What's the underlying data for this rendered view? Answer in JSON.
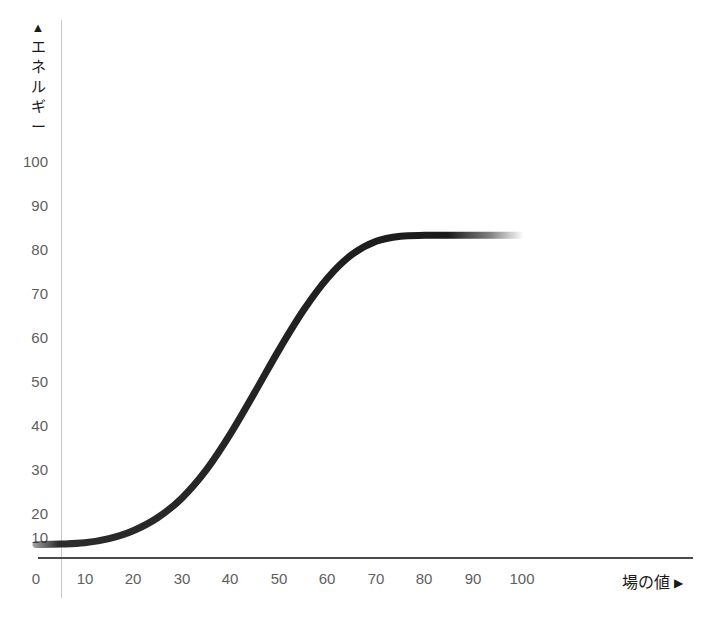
{
  "chart_data": {
    "type": "line",
    "title": "",
    "xlabel": "場の値",
    "ylabel": "エネルギー",
    "xlabel_arrow": "▶",
    "ylabel_arrow": "▲",
    "ylabel_chars": [
      "エ",
      "ネ",
      "ル",
      "ギ",
      "ー"
    ],
    "xticks": [
      0,
      10,
      20,
      30,
      40,
      50,
      60,
      70,
      80,
      90,
      100
    ],
    "xtick_labels": [
      "0",
      "10",
      "20",
      "30",
      "40",
      "50",
      "60",
      "70",
      "80",
      "90",
      "100"
    ],
    "yticks": [
      10,
      20,
      30,
      40,
      50,
      60,
      70,
      80,
      90,
      100
    ],
    "ytick_labels": [
      "10",
      "20",
      "30",
      "40",
      "50",
      "60",
      "70",
      "80",
      "90",
      "100"
    ],
    "xlim": [
      0,
      100
    ],
    "ylim": [
      0,
      108
    ],
    "grid": false,
    "legend": null,
    "series": [
      {
        "name": "energy-curve",
        "shape": "sigmoid",
        "color": "#1a1a1a",
        "line_width": 7,
        "fade_ends": true,
        "x": [
          0,
          5,
          10,
          15,
          20,
          25,
          30,
          35,
          40,
          45,
          50,
          55,
          60,
          65,
          70,
          75,
          80,
          85,
          90,
          95,
          100
        ],
        "y": [
          8.2,
          8.3,
          8.6,
          9.6,
          11.5,
          14.6,
          19.3,
          26.0,
          34.7,
          44.6,
          54.8,
          64.2,
          72.0,
          77.6,
          80.8,
          82.0,
          82.2,
          82.2,
          82.2,
          82.2,
          82.2
        ]
      }
    ],
    "annotations": [],
    "axis_colors": {
      "x_axis": "#4a4a4a",
      "y_axis": "#c9c9c9",
      "tick_text": "#5e5e5e",
      "title_text": "#1a1a1a",
      "background": "#ffffff"
    }
  }
}
